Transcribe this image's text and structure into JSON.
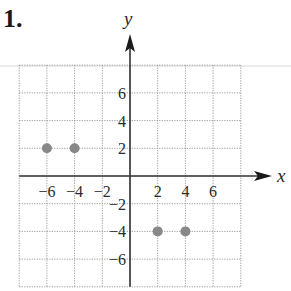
{
  "problem": {
    "number_label": "1."
  },
  "chart_data": {
    "type": "scatter",
    "title": "",
    "xlabel": "x",
    "ylabel": "y",
    "xlim": [
      -8,
      8
    ],
    "ylim": [
      -8,
      8
    ],
    "grid": true,
    "grid_step": 2,
    "x_tick_labels": [
      {
        "value": -6,
        "label": "−6"
      },
      {
        "value": -4,
        "label": "−4"
      },
      {
        "value": -2,
        "label": "−2"
      },
      {
        "value": 2,
        "label": "2"
      },
      {
        "value": 4,
        "label": "4"
      },
      {
        "value": 6,
        "label": "6"
      }
    ],
    "y_tick_labels": [
      {
        "value": 6,
        "label": "6"
      },
      {
        "value": 4,
        "label": "4"
      },
      {
        "value": 2,
        "label": "2"
      },
      {
        "value": -2,
        "label": "−2"
      },
      {
        "value": -4,
        "label": "−4"
      },
      {
        "value": -6,
        "label": "−6"
      }
    ],
    "points": [
      {
        "x": -6,
        "y": 2
      },
      {
        "x": -4,
        "y": 2
      },
      {
        "x": 2,
        "y": -4
      },
      {
        "x": 4,
        "y": -4
      }
    ],
    "point_color": "#888888",
    "axis_color": "#333333",
    "grid_color": "#9a9a9a"
  }
}
